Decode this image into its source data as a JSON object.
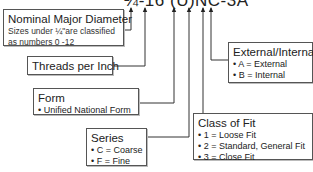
{
  "designation": "¼-16 (U)NC-3A",
  "boxes": {
    "nominal": {
      "title": "Nominal Major Diameter",
      "note": "Sizes under ¼\"are classified as numbers 0 -12"
    },
    "threads": {
      "title": "Threads per Inch"
    },
    "form": {
      "title": "Form",
      "items": [
        "• Unified National Form"
      ]
    },
    "series": {
      "title": "Series",
      "items": [
        "• C = Coarse",
        "• F = Fine"
      ]
    },
    "class_of_fit": {
      "title": "Class of Fit",
      "items": [
        "• 1 = Loose Fit",
        "• 2 = Standard, General Fit",
        "• 3 = Close Fit"
      ]
    },
    "ext_int": {
      "title": "External/Internal",
      "items": [
        "• A = External",
        "• B = Internal"
      ]
    }
  }
}
